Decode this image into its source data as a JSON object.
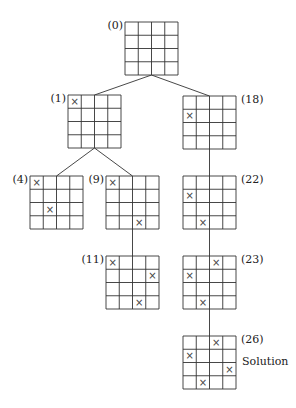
{
  "diagram": {
    "type": "search-tree",
    "board_size": 4,
    "cell_px": 13.25,
    "mark_glyph": "×",
    "line_color": "#333333",
    "mark_color": "#444444",
    "nodes": [
      {
        "id": "n0",
        "label": "(0)",
        "x": 125,
        "y": 22,
        "label_side": "left",
        "marks": []
      },
      {
        "id": "n1",
        "label": "(1)",
        "x": 68,
        "y": 95,
        "label_side": "left",
        "marks": [
          [
            0,
            0
          ]
        ]
      },
      {
        "id": "n18",
        "label": "(18)",
        "x": 183,
        "y": 96,
        "label_side": "right",
        "marks": [
          [
            1,
            0
          ]
        ]
      },
      {
        "id": "n4",
        "label": "(4)",
        "x": 30,
        "y": 176,
        "label_side": "left",
        "marks": [
          [
            0,
            0
          ],
          [
            2,
            1
          ]
        ]
      },
      {
        "id": "n9",
        "label": "(9)",
        "x": 106,
        "y": 176,
        "label_side": "left",
        "marks": [
          [
            0,
            0
          ],
          [
            3,
            2
          ]
        ]
      },
      {
        "id": "n22",
        "label": "(22)",
        "x": 183,
        "y": 176,
        "label_side": "right",
        "marks": [
          [
            1,
            0
          ],
          [
            3,
            1
          ]
        ]
      },
      {
        "id": "n11",
        "label": "(11)",
        "x": 106,
        "y": 256,
        "label_side": "left",
        "marks": [
          [
            0,
            0
          ],
          [
            1,
            3
          ],
          [
            3,
            2
          ]
        ]
      },
      {
        "id": "n23",
        "label": "(23)",
        "x": 183,
        "y": 256,
        "label_side": "right",
        "marks": [
          [
            0,
            2
          ],
          [
            1,
            0
          ],
          [
            3,
            1
          ]
        ]
      },
      {
        "id": "n26",
        "label": "(26)",
        "x": 183,
        "y": 336,
        "label_side": "right",
        "marks": [
          [
            0,
            2
          ],
          [
            1,
            0
          ],
          [
            2,
            3
          ],
          [
            3,
            1
          ]
        ]
      }
    ],
    "edges": [
      [
        "n0",
        "n1"
      ],
      [
        "n0",
        "n18"
      ],
      [
        "n1",
        "n4"
      ],
      [
        "n1",
        "n9"
      ],
      [
        "n9",
        "n11"
      ],
      [
        "n18",
        "n22"
      ],
      [
        "n22",
        "n23"
      ],
      [
        "n23",
        "n26"
      ]
    ],
    "solution": {
      "node": "n26",
      "text": "Solution"
    }
  }
}
